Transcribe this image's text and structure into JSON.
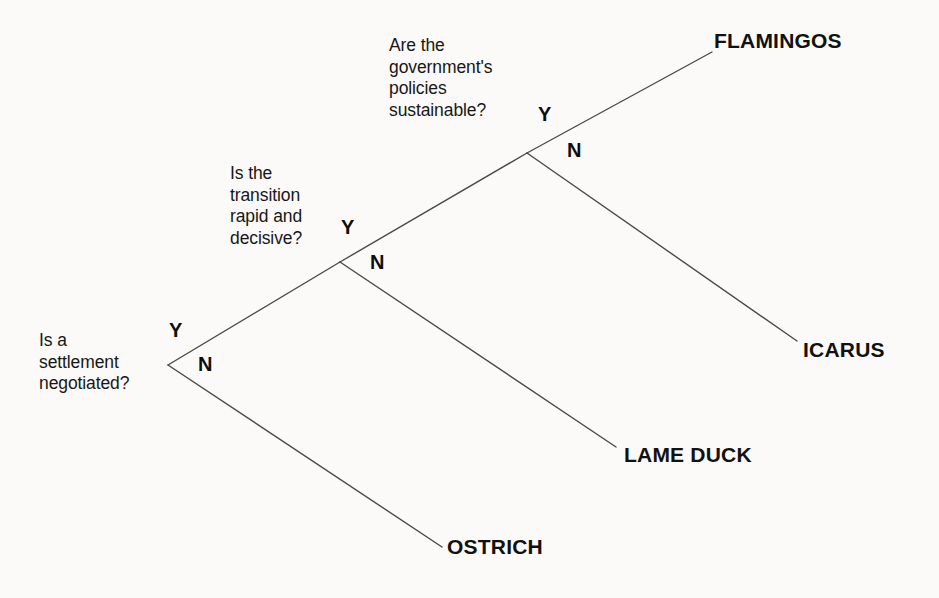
{
  "diagram": {
    "type": "decision-tree",
    "background_color": "#fbfaf8",
    "line_color": "#4a4a4a",
    "text_color": "#171717",
    "nodes": [
      {
        "id": "node1",
        "question": "Is a\nsettlement\nnegotiated?",
        "yes_label": "Y",
        "no_label": "N",
        "vertex": [
          168,
          365
        ]
      },
      {
        "id": "node2",
        "question": "Is the\ntransition\nrapid and\ndecisive?",
        "yes_label": "Y",
        "no_label": "N",
        "vertex": [
          340,
          262
        ]
      },
      {
        "id": "node3",
        "question": "Are the\ngovernment's\npolicies\nsustainable?",
        "yes_label": "Y",
        "no_label": "N",
        "vertex": [
          527,
          153
        ]
      }
    ],
    "outcomes": [
      {
        "id": "flamingos",
        "label": "FLAMINGOS",
        "endpoint": [
          712,
          52
        ]
      },
      {
        "id": "icarus",
        "label": "ICARUS",
        "endpoint": [
          797,
          341
        ]
      },
      {
        "id": "lame-duck",
        "label": "LAME DUCK",
        "endpoint": [
          616,
          447
        ]
      },
      {
        "id": "ostrich",
        "label": "OSTRICH",
        "endpoint": [
          442,
          547
        ]
      }
    ],
    "edges": [
      {
        "from": "node1",
        "to": "node2",
        "branch": "Y",
        "x1": 168,
        "y1": 365,
        "x2": 340,
        "y2": 262
      },
      {
        "from": "node1",
        "to": "ostrich",
        "branch": "N",
        "x1": 168,
        "y1": 365,
        "x2": 442,
        "y2": 547
      },
      {
        "from": "node2",
        "to": "node3",
        "branch": "Y",
        "x1": 340,
        "y1": 262,
        "x2": 527,
        "y2": 153
      },
      {
        "from": "node2",
        "to": "lame-duck",
        "branch": "N",
        "x1": 340,
        "y1": 262,
        "x2": 616,
        "y2": 447
      },
      {
        "from": "node3",
        "to": "flamingos",
        "branch": "Y",
        "x1": 527,
        "y1": 153,
        "x2": 712,
        "y2": 52
      },
      {
        "from": "node3",
        "to": "icarus",
        "branch": "N",
        "x1": 527,
        "y1": 153,
        "x2": 797,
        "y2": 341
      }
    ]
  }
}
